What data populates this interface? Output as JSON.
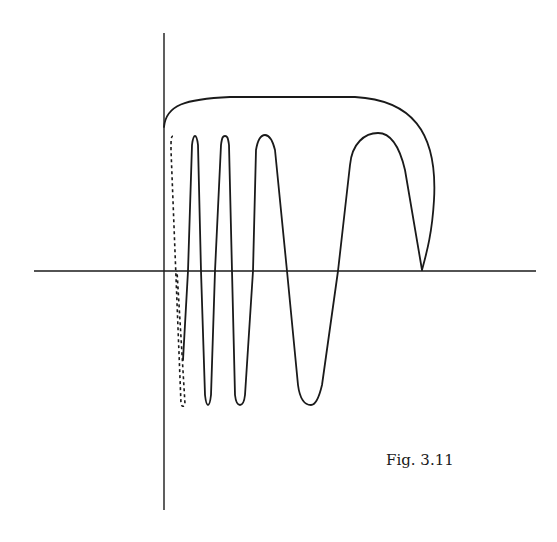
{
  "figure": {
    "caption": "Fig. 3.11",
    "colors": {
      "ink": "#1a1a1a",
      "background": "#ffffff"
    },
    "axes": {
      "horizontal": {
        "x1": 34,
        "x2": 536,
        "y": 271
      },
      "vertical": {
        "x": 164,
        "y1": 33,
        "y2": 510
      }
    },
    "curves": {
      "top_arc": "M164,127 C166,105 185,99 230,97 L355,97 C410,100 438,130 434,200 C432,235 426,255 422,270",
      "dotted_branch": "M173,136 C171,136 171,140 171,150 L181,404 C182,407 184,407 185,404 L177,271",
      "main_oscillation": "M422,270 L405,170 C398,140 388,133 378,133 C365,133 352,143 350,165 L338,271 L322,385 C318,402 314,405 311,405 C305,405 300,400 298,385 L287,271 L275,150 C272,138 268,135 265,135 C261,135 258,138 256,150 L253,271 L245,395 C244,404 242,405 240,405 C238,405 236,404 235,395 L232,271 L229,145 C228,137 227,136 225,136 C223,136 222,137 221,145 L215,271 L211,395 C210,404 209,405 208,405 C207,405 206,404 205,395 L201,271 L198,145 C197,137 196,136 195,136 C194,136 193,137 192,145 L188,271 L183,360"
    }
  }
}
